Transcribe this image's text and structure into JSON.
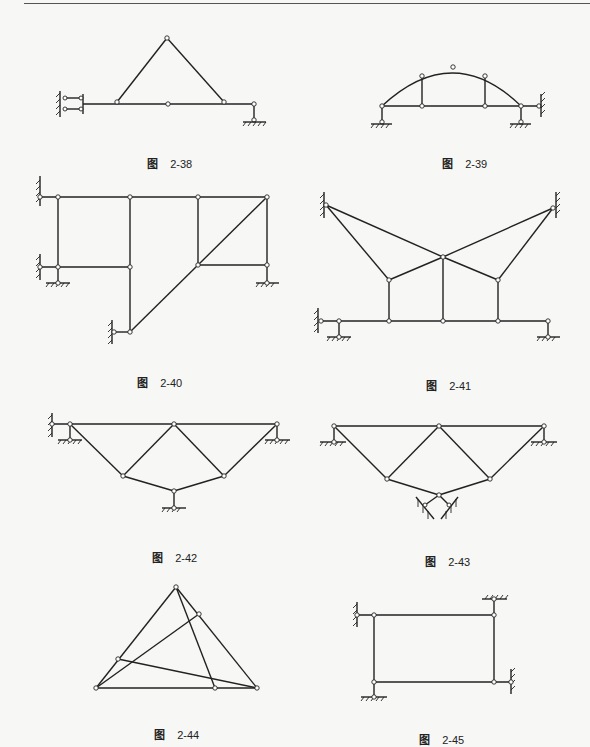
{
  "page": {
    "background": "#f7f7f5",
    "line_color": "#222222"
  },
  "figures": [
    {
      "id": "2-38",
      "caption_prefix": "图",
      "caption_number": "2-38",
      "description": "Triangle truss on beam with double-link wall support at left and pin support at right"
    },
    {
      "id": "2-39",
      "caption_prefix": "图",
      "caption_number": "2-39",
      "description": "Arch with two verticals over tie beam, pinned supports and wall link at right"
    },
    {
      "id": "2-40",
      "caption_prefix": "图",
      "caption_number": "2-40",
      "description": "Multi-panel frame with diagonal member and wall/ground supports"
    },
    {
      "id": "2-41",
      "caption_prefix": "图",
      "caption_number": "2-41",
      "description": "Suspended system with two wall anchors above and beam below"
    },
    {
      "id": "2-42",
      "caption_prefix": "图",
      "caption_number": "2-42",
      "description": "Inverted triangular truss with central bottom support"
    },
    {
      "id": "2-43",
      "caption_prefix": "图",
      "caption_number": "2-43",
      "description": "Inverted triangular truss with inclined link supports at bottom"
    },
    {
      "id": "2-44",
      "caption_prefix": "图",
      "caption_number": "2-44",
      "description": "Triangle with internal crossing members, no supports"
    },
    {
      "id": "2-45",
      "caption_prefix": "图",
      "caption_number": "2-45",
      "description": "Rectangular frame with four link supports"
    }
  ]
}
